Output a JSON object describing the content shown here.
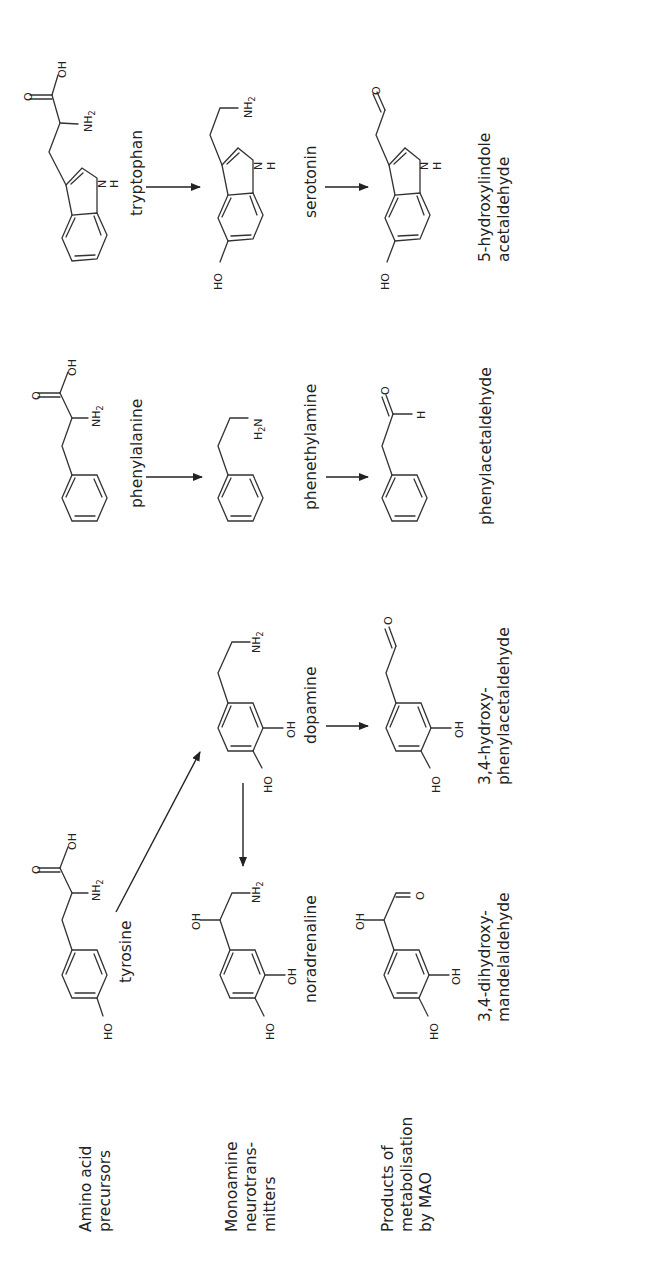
{
  "figure": {
    "orientation": "rotated -90deg (reads bottom-to-top)",
    "row_labels": [
      {
        "lines": [
          "Amino acid",
          "precursors"
        ]
      },
      {
        "lines": [
          "Monoamine",
          "neurotrans-",
          "mitters"
        ]
      },
      {
        "lines": [
          "Products of",
          "metabolisation",
          "by MAO"
        ]
      }
    ],
    "pathways": [
      {
        "precursor": "tryptophan",
        "neurotransmitter": "serotonin",
        "metabolite": [
          "5-hydroxylindole",
          "acetaldehyde"
        ]
      },
      {
        "precursor": "phenylalanine",
        "neurotransmitter": "phenethylamine",
        "metabolite": [
          "phenylacetaldehyde"
        ]
      },
      {
        "precursor": "tyrosine",
        "neurotransmitters": [
          "dopamine",
          "noradrenaline"
        ],
        "metabolites": [
          [
            "3,4-hydroxy-",
            "phenylacetaldehyde"
          ],
          [
            "3,4-dihydroxy-",
            "mandelaldehyde"
          ]
        ]
      }
    ],
    "atoms": {
      "oh": "OH",
      "ho": "HO",
      "o": "O",
      "nh2": "NH",
      "sub2": "2",
      "h2n": "H",
      "n": "N",
      "h": "H"
    }
  }
}
